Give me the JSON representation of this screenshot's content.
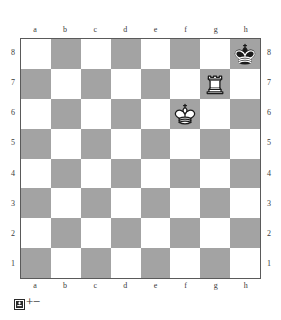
{
  "diagram": {
    "files_top": [
      "a",
      "b",
      "c",
      "d",
      "e",
      "f",
      "g",
      "h"
    ],
    "files_bottom": [
      "a",
      "b",
      "c",
      "d",
      "e",
      "f",
      "g",
      "h"
    ],
    "ranks_left": [
      "8",
      "7",
      "6",
      "5",
      "4",
      "3",
      "2",
      "1"
    ],
    "ranks_right": [
      "8",
      "7",
      "6",
      "5",
      "4",
      "3",
      "2",
      "1"
    ],
    "colors": {
      "light_square": "#ffffff",
      "dark_square": "#a3a3a3",
      "border": "#5a5a5a",
      "label": "#3a3a3a",
      "page_background": "#ffffff"
    }
  },
  "footer": {
    "turn_icon": "black-king-to-move-icon",
    "evaluation": "+−"
  },
  "chart_data": {
    "type": "table",
    "board_orientation": "white-bottom",
    "files": [
      "a",
      "b",
      "c",
      "d",
      "e",
      "f",
      "g",
      "h"
    ],
    "ranks": [
      "8",
      "7",
      "6",
      "5",
      "4",
      "3",
      "2",
      "1"
    ],
    "squares": [
      {
        "square": "h8",
        "piece": "king",
        "color": "black",
        "glyph": "♚"
      },
      {
        "square": "g7",
        "piece": "rook",
        "color": "white",
        "glyph": "♖"
      },
      {
        "square": "f6",
        "piece": "king",
        "color": "white",
        "glyph": "♔"
      }
    ],
    "side_to_move": "black",
    "evaluation_symbol": "+−",
    "evaluation_meaning": "White is winning",
    "piece_count": 3,
    "fen": "7k/6R1/5K2/8/8/8/8/8 b - - 0 1"
  }
}
